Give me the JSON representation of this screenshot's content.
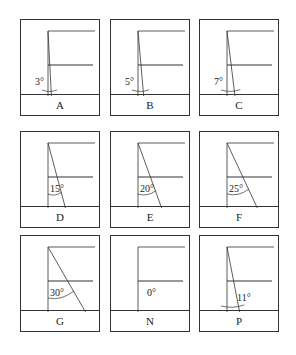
{
  "panels": [
    {
      "id": "A",
      "label": "A",
      "angle": 3,
      "angle_text": "3°",
      "left": 20,
      "top": 19
    },
    {
      "id": "B",
      "label": "B",
      "angle": 5,
      "angle_text": "5°",
      "left": 110,
      "top": 19
    },
    {
      "id": "C",
      "label": "C",
      "angle": 7,
      "angle_text": "7°",
      "left": 199,
      "top": 19
    },
    {
      "id": "D",
      "label": "D",
      "angle": 15,
      "angle_text": "15°",
      "left": 20,
      "top": 131
    },
    {
      "id": "E",
      "label": "E",
      "angle": 20,
      "angle_text": "20°",
      "left": 110,
      "top": 131
    },
    {
      "id": "F",
      "label": "F",
      "angle": 25,
      "angle_text": "25°",
      "left": 199,
      "top": 131
    },
    {
      "id": "G",
      "label": "G",
      "angle": 30,
      "angle_text": "30°",
      "left": 20,
      "top": 235
    },
    {
      "id": "N",
      "label": "N",
      "angle": 0,
      "angle_text": "0°",
      "left": 110,
      "top": 235
    },
    {
      "id": "P",
      "label": "P",
      "angle": 11,
      "angle_text": "11°",
      "left": 199,
      "top": 235
    }
  ],
  "colors": {
    "line": "#333333",
    "background": "#ffffff"
  }
}
